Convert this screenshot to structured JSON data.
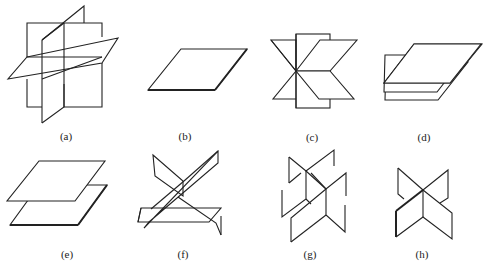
{
  "figure": {
    "type": "plane-configurations",
    "stroke_color": "#222222",
    "background": "#ffffff",
    "panels": [
      {
        "id": "a",
        "label": "(a)",
        "description": "three mutually perpendicular intersecting planes"
      },
      {
        "id": "b",
        "label": "(b)",
        "description": "single plane"
      },
      {
        "id": "c",
        "label": "(c)",
        "description": "three planes sharing a common line"
      },
      {
        "id": "d",
        "label": "(d)",
        "description": "three parallel planes"
      },
      {
        "id": "e",
        "label": "(e)",
        "description": "two parallel planes"
      },
      {
        "id": "f",
        "label": "(f)",
        "description": "three planes intersecting pairwise in three lines (prism-like)"
      },
      {
        "id": "g",
        "label": "(g)",
        "description": "two intersecting planes cut by a third forming parallel lines"
      },
      {
        "id": "h",
        "label": "(h)",
        "description": "two intersecting planes"
      }
    ]
  }
}
